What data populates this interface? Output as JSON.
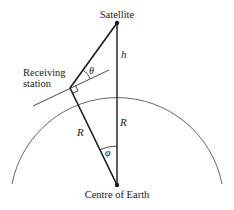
{
  "diagram": {
    "labels": {
      "satellite": "Satellite",
      "station_line1": "Receiving",
      "station_line2": "station",
      "centre": "Centre of Earth",
      "height": "h",
      "theta": "θ",
      "radius_upper": "R",
      "radius_lower": "R",
      "phi": "φ"
    },
    "colors": {
      "line": "#1a1a1a",
      "arc": "#555555",
      "background": "#ffffff"
    }
  }
}
